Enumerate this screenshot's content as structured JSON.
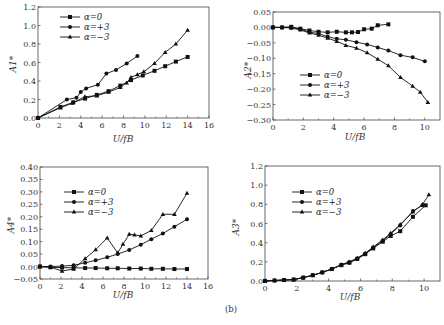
{
  "figure_label": "(b)",
  "chart_data": [
    {
      "type": "line",
      "id": "A1",
      "xlabel": "U/fB",
      "ylabel": "A1*",
      "xlim": [
        0,
        16
      ],
      "ylim": [
        0,
        1.2
      ],
      "xticks": [
        0,
        2,
        4,
        6,
        8,
        10,
        12,
        14,
        16
      ],
      "yticks": [
        0.0,
        0.2,
        0.4,
        0.6,
        0.8,
        1.0,
        1.2
      ],
      "ytick_labels": [
        "0.0",
        "0.2",
        "0.4",
        "0.6",
        "0.8",
        "1.0",
        "1.2"
      ],
      "legend_position": "top-left",
      "series": [
        {
          "name": "α=0",
          "marker": "square",
          "points": [
            [
              0,
              0
            ],
            [
              2.1,
              0.12
            ],
            [
              3.3,
              0.17
            ],
            [
              4.4,
              0.21
            ],
            [
              5.5,
              0.25
            ],
            [
              6.6,
              0.29
            ],
            [
              7.7,
              0.35
            ],
            [
              8.7,
              0.41
            ],
            [
              9.8,
              0.46
            ],
            [
              10.9,
              0.51
            ],
            [
              11.9,
              0.56
            ],
            [
              12.9,
              0.61
            ],
            [
              14,
              0.66
            ]
          ]
        },
        {
          "name": "α=+3",
          "marker": "circle",
          "points": [
            [
              0,
              0
            ],
            [
              2.7,
              0.2
            ],
            [
              3.6,
              0.22
            ],
            [
              4.0,
              0.28
            ],
            [
              4.5,
              0.32
            ],
            [
              5.6,
              0.36
            ],
            [
              6.4,
              0.48
            ],
            [
              7.3,
              0.52
            ],
            [
              8.3,
              0.59
            ],
            [
              9.3,
              0.67
            ]
          ]
        },
        {
          "name": "α=−3",
          "marker": "triangle",
          "points": [
            [
              0,
              0
            ],
            [
              2.1,
              0.11
            ],
            [
              3.2,
              0.16
            ],
            [
              4.4,
              0.23
            ],
            [
              5.5,
              0.24
            ],
            [
              6.6,
              0.28
            ],
            [
              7.7,
              0.33
            ],
            [
              8.3,
              0.38
            ],
            [
              8.7,
              0.44
            ],
            [
              9.3,
              0.47
            ],
            [
              9.9,
              0.5
            ],
            [
              10.9,
              0.59
            ],
            [
              11.9,
              0.71
            ],
            [
              12.9,
              0.8
            ],
            [
              14,
              0.95
            ]
          ]
        }
      ]
    },
    {
      "type": "line",
      "id": "A2",
      "xlabel": "U/fB",
      "ylabel": "A2*",
      "xlim": [
        0,
        11
      ],
      "ylim": [
        -0.3,
        0.05
      ],
      "xticks": [
        0,
        2,
        4,
        6,
        8,
        10
      ],
      "yticks": [
        0.05,
        0.0,
        -0.05,
        -0.1,
        -0.15,
        -0.2,
        -0.25,
        -0.3
      ],
      "ytick_labels": [
        "0.05",
        "0.00",
        "−0.05",
        "−0.10",
        "−0.15",
        "−0.20",
        "−0.25",
        "−0.30"
      ],
      "legend_position": "bottom-left",
      "series": [
        {
          "name": "α=0",
          "marker": "square",
          "points": [
            [
              0,
              0
            ],
            [
              0.6,
              0
            ],
            [
              1.2,
              0.002
            ],
            [
              1.8,
              -0.004
            ],
            [
              2.4,
              -0.01
            ],
            [
              3.0,
              -0.014
            ],
            [
              3.6,
              -0.016
            ],
            [
              4.2,
              -0.014
            ],
            [
              4.8,
              -0.016
            ],
            [
              5.2,
              -0.016
            ],
            [
              5.6,
              -0.015
            ],
            [
              6.0,
              -0.006
            ],
            [
              6.5,
              -0.004
            ],
            [
              6.9,
              0.007
            ],
            [
              7.6,
              0.01
            ]
          ]
        },
        {
          "name": "α=+3",
          "marker": "circle",
          "points": [
            [
              0,
              0
            ],
            [
              0.6,
              0
            ],
            [
              1.2,
              0
            ],
            [
              1.8,
              -0.005
            ],
            [
              2.4,
              -0.015
            ],
            [
              3.0,
              -0.02
            ],
            [
              3.6,
              -0.03
            ],
            [
              4.2,
              -0.037
            ],
            [
              4.8,
              -0.04
            ],
            [
              5.5,
              -0.048
            ],
            [
              6.2,
              -0.055
            ],
            [
              6.9,
              -0.065
            ],
            [
              7.6,
              -0.075
            ],
            [
              8.4,
              -0.09
            ],
            [
              9.2,
              -0.097
            ],
            [
              10.0,
              -0.11
            ]
          ]
        },
        {
          "name": "α=−3",
          "marker": "triangle",
          "points": [
            [
              0,
              0
            ],
            [
              0.6,
              0
            ],
            [
              1.2,
              -0.002
            ],
            [
              1.8,
              -0.008
            ],
            [
              2.4,
              -0.018
            ],
            [
              3.0,
              -0.025
            ],
            [
              3.6,
              -0.035
            ],
            [
              4.2,
              -0.045
            ],
            [
              4.8,
              -0.058
            ],
            [
              5.5,
              -0.067
            ],
            [
              6.2,
              -0.082
            ],
            [
              6.9,
              -0.103
            ],
            [
              7.6,
              -0.124
            ],
            [
              8.4,
              -0.162
            ],
            [
              9.2,
              -0.19
            ],
            [
              9.7,
              -0.21
            ],
            [
              10.2,
              -0.243
            ]
          ]
        }
      ]
    },
    {
      "type": "line",
      "id": "A4",
      "xlabel": "U/fB",
      "ylabel": "A4*",
      "xlim": [
        0,
        16
      ],
      "ylim": [
        -0.05,
        0.4
      ],
      "xticks": [
        0,
        2,
        4,
        6,
        8,
        10,
        12,
        14,
        16
      ],
      "yticks": [
        0.4,
        0.35,
        0.3,
        0.25,
        0.2,
        0.15,
        0.1,
        0.05,
        0.0,
        -0.05
      ],
      "ytick_labels": [
        "0.40",
        "0.35",
        "0.30",
        "0.25",
        "0.20",
        "0.15",
        "0.10",
        "0.05",
        "0.00",
        "−0.05"
      ],
      "legend_position": "top-left",
      "series": [
        {
          "name": "α=0",
          "marker": "square",
          "points": [
            [
              0,
              0
            ],
            [
              1,
              -0.003
            ],
            [
              2.1,
              -0.004
            ],
            [
              3.2,
              -0.005
            ],
            [
              4.3,
              -0.006
            ],
            [
              5.3,
              -0.006
            ],
            [
              6.4,
              -0.007
            ],
            [
              7.4,
              -0.007
            ],
            [
              8.5,
              -0.008
            ],
            [
              9.6,
              -0.008
            ],
            [
              10.6,
              -0.009
            ],
            [
              11.7,
              -0.009
            ],
            [
              12.8,
              -0.01
            ],
            [
              14,
              -0.01
            ]
          ]
        },
        {
          "name": "α=+3",
          "marker": "circle",
          "points": [
            [
              0,
              0
            ],
            [
              1,
              0
            ],
            [
              2.1,
              0.002
            ],
            [
              3.2,
              0.005
            ],
            [
              4.3,
              0.015
            ],
            [
              5.3,
              0.025
            ],
            [
              6.4,
              0.037
            ],
            [
              7.4,
              0.05
            ],
            [
              8.5,
              0.067
            ],
            [
              9.6,
              0.088
            ],
            [
              10.6,
              0.11
            ],
            [
              11.7,
              0.133
            ],
            [
              12.8,
              0.16
            ],
            [
              14,
              0.19
            ]
          ]
        },
        {
          "name": "α=−3",
          "marker": "triangle",
          "points": [
            [
              0,
              0
            ],
            [
              1,
              -0.002
            ],
            [
              2.1,
              -0.018
            ],
            [
              3.2,
              -0.01
            ],
            [
              4.3,
              0.032
            ],
            [
              5.3,
              0.068
            ],
            [
              6.4,
              0.115
            ],
            [
              7.4,
              0.055
            ],
            [
              7.9,
              0.09
            ],
            [
              8.5,
              0.13
            ],
            [
              9,
              0.127
            ],
            [
              9.6,
              0.123
            ],
            [
              10.6,
              0.145
            ],
            [
              11.7,
              0.21
            ],
            [
              12.8,
              0.21
            ],
            [
              14,
              0.295
            ]
          ]
        }
      ]
    },
    {
      "type": "line",
      "id": "A3",
      "xlabel": "U/fB",
      "ylabel": "A3*",
      "xlim": [
        0,
        11
      ],
      "ylim": [
        0,
        1.2
      ],
      "xticks": [
        0,
        2,
        4,
        6,
        8,
        10
      ],
      "yticks": [
        0.0,
        0.2,
        0.4,
        0.6,
        0.8,
        1.0,
        1.2
      ],
      "ytick_labels": [
        "0.0",
        "0.2",
        "0.4",
        "0.6",
        "0.8",
        "1.0",
        "1.2"
      ],
      "legend_position": "top-left",
      "series": [
        {
          "name": "α=0",
          "marker": "square",
          "points": [
            [
              0,
              0
            ],
            [
              0.6,
              0.005
            ],
            [
              1.2,
              0.01
            ],
            [
              1.8,
              0.015
            ],
            [
              2.4,
              0.035
            ],
            [
              3.0,
              0.06
            ],
            [
              3.6,
              0.09
            ],
            [
              4.2,
              0.125
            ],
            [
              4.8,
              0.165
            ],
            [
              5.3,
              0.19
            ],
            [
              5.8,
              0.23
            ],
            [
              6.3,
              0.28
            ],
            [
              6.8,
              0.34
            ],
            [
              7.4,
              0.41
            ],
            [
              7.9,
              0.47
            ],
            [
              8.5,
              0.52
            ],
            [
              9.3,
              0.67
            ],
            [
              10.1,
              0.79
            ]
          ]
        },
        {
          "name": "α=+3",
          "marker": "circle",
          "points": [
            [
              0,
              0
            ],
            [
              0.6,
              0.005
            ],
            [
              1.2,
              0.01
            ],
            [
              1.8,
              0.015
            ],
            [
              2.4,
              0.035
            ],
            [
              3.0,
              0.06
            ],
            [
              3.6,
              0.09
            ],
            [
              4.2,
              0.125
            ],
            [
              4.8,
              0.17
            ],
            [
              5.3,
              0.195
            ],
            [
              5.8,
              0.235
            ],
            [
              6.3,
              0.285
            ],
            [
              6.8,
              0.35
            ],
            [
              7.4,
              0.42
            ],
            [
              7.9,
              0.49
            ],
            [
              8.5,
              0.58
            ],
            [
              9.3,
              0.73
            ],
            [
              9.9,
              0.79
            ]
          ]
        },
        {
          "name": "α=−3",
          "marker": "triangle",
          "points": [
            [
              0,
              0
            ],
            [
              0.6,
              0.005
            ],
            [
              1.2,
              0.01
            ],
            [
              1.8,
              0.015
            ],
            [
              2.4,
              0.035
            ],
            [
              3.0,
              0.06
            ],
            [
              3.6,
              0.09
            ],
            [
              4.2,
              0.125
            ],
            [
              4.8,
              0.17
            ],
            [
              5.3,
              0.2
            ],
            [
              5.8,
              0.24
            ],
            [
              6.3,
              0.29
            ],
            [
              6.8,
              0.355
            ],
            [
              7.4,
              0.43
            ],
            [
              7.9,
              0.5
            ],
            [
              8.5,
              0.59
            ],
            [
              9.3,
              0.72
            ],
            [
              9.9,
              0.8
            ],
            [
              10.3,
              0.9
            ]
          ]
        }
      ]
    }
  ]
}
